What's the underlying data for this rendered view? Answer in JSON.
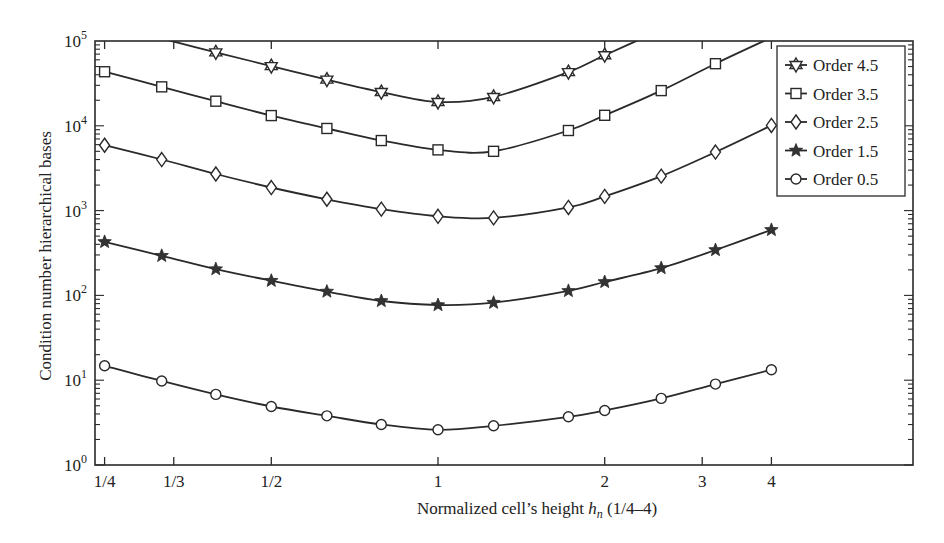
{
  "chart_data": {
    "type": "line",
    "title": "",
    "xlabel": "Normalized cell's height h_n (1/4–4)",
    "xlabel_parts": {
      "prefix": "Normalized cell’s height ",
      "var": "h",
      "sub": "n",
      "suffix": " (1/4–4)"
    },
    "ylabel": "Condition number hierarchical bases",
    "xscale": "log2",
    "yscale": "log10",
    "xlim": [
      0.24,
      7.2
    ],
    "ylim": [
      1,
      100000
    ],
    "x_ticks": [
      {
        "value": 0.25,
        "label": "1/4"
      },
      {
        "value": 0.3333,
        "label": "1/3"
      },
      {
        "value": 0.5,
        "label": "1/2"
      },
      {
        "value": 1,
        "label": "1"
      },
      {
        "value": 2,
        "label": "2"
      },
      {
        "value": 3,
        "label": "3"
      },
      {
        "value": 4,
        "label": "4"
      }
    ],
    "y_ticks": [
      {
        "value": 1,
        "base": "10",
        "exp": "0"
      },
      {
        "value": 10,
        "base": "10",
        "exp": "1"
      },
      {
        "value": 100,
        "base": "10",
        "exp": "2"
      },
      {
        "value": 1000,
        "base": "10",
        "exp": "3"
      },
      {
        "value": 10000,
        "base": "10",
        "exp": "4"
      },
      {
        "value": 100000,
        "base": "10",
        "exp": "5"
      }
    ],
    "grid": false,
    "legend_position": "upper right",
    "x": [
      0.25,
      0.317,
      0.397,
      0.5,
      0.63,
      0.79,
      1.0,
      1.26,
      1.72,
      2.0,
      2.53,
      3.17,
      4.0
    ],
    "series": [
      {
        "name": "Order 4.5",
        "marker": "star6-open",
        "values": [
          null,
          null,
          73500,
          50600,
          35000,
          25000,
          19100,
          21900,
          43000,
          68000,
          null,
          null,
          null
        ]
      },
      {
        "name": "Order 3.5",
        "marker": "square-open",
        "values": [
          43400,
          28800,
          19500,
          13200,
          9300,
          6700,
          5200,
          5000,
          8800,
          13300,
          26000,
          54000,
          null
        ]
      },
      {
        "name": "Order 2.5",
        "marker": "diamond-open",
        "values": [
          5900,
          4000,
          2700,
          1870,
          1360,
          1040,
          857,
          820,
          1090,
          1470,
          2550,
          4900,
          10100
        ]
      },
      {
        "name": "Order 1.5",
        "marker": "star-filled",
        "values": [
          427,
          293,
          204,
          149,
          111,
          86,
          77,
          82,
          113,
          144,
          210,
          343,
          592
        ]
      },
      {
        "name": "Order 0.5",
        "marker": "circle-open",
        "values": [
          14.8,
          9.8,
          6.8,
          4.9,
          3.8,
          3.0,
          2.6,
          2.9,
          3.7,
          4.4,
          6.1,
          9.0,
          13.3
        ]
      }
    ],
    "legend": [
      "Order 4.5",
      "Order 3.5",
      "Order 2.5",
      "Order 1.5",
      "Order 0.5"
    ]
  },
  "colors": {
    "line": "#2a2a2a",
    "background": "#ffffff"
  }
}
